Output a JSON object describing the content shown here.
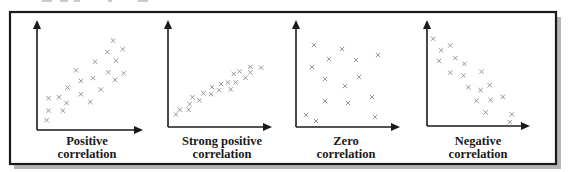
{
  "chart_data": [
    {
      "type": "scatter",
      "title": "",
      "label_lines": [
        "Positive",
        "correlation"
      ],
      "xlabel": "",
      "ylabel": "",
      "xlim": [
        0,
        100
      ],
      "ylim": [
        0,
        100
      ],
      "grid": false,
      "marker": "x",
      "points": [
        [
          77,
          89
        ],
        [
          87,
          80
        ],
        [
          71,
          77
        ],
        [
          58,
          67
        ],
        [
          80,
          68
        ],
        [
          38,
          58
        ],
        [
          72,
          56
        ],
        [
          88,
          55
        ],
        [
          43,
          47
        ],
        [
          56,
          50
        ],
        [
          79,
          48
        ],
        [
          29,
          40
        ],
        [
          64,
          38
        ],
        [
          43,
          33
        ],
        [
          9,
          29
        ],
        [
          20,
          30
        ],
        [
          28,
          24
        ],
        [
          53,
          25
        ],
        [
          9,
          16
        ],
        [
          24,
          16
        ],
        [
          7,
          6
        ]
      ]
    },
    {
      "type": "scatter",
      "title": "",
      "label_lines": [
        "Strong positive",
        "correlation"
      ],
      "xlabel": "",
      "ylabel": "",
      "xlim": [
        0,
        100
      ],
      "ylim": [
        0,
        100
      ],
      "grid": false,
      "marker": "x",
      "points": [
        [
          82,
          72
        ],
        [
          93,
          71
        ],
        [
          71,
          66
        ],
        [
          82,
          65
        ],
        [
          65,
          63
        ],
        [
          77,
          58
        ],
        [
          59,
          52
        ],
        [
          67,
          52
        ],
        [
          52,
          50
        ],
        [
          43,
          46
        ],
        [
          50,
          42
        ],
        [
          62,
          43
        ],
        [
          34,
          38
        ],
        [
          42,
          37
        ],
        [
          23,
          33
        ],
        [
          30,
          29
        ],
        [
          20,
          24
        ],
        [
          10,
          17
        ],
        [
          19,
          17
        ],
        [
          6,
          11
        ]
      ]
    },
    {
      "type": "scatter",
      "title": "",
      "label_lines": [
        "Zero",
        "correlation"
      ],
      "xlabel": "",
      "ylabel": "",
      "xlim": [
        0,
        100
      ],
      "ylim": [
        0,
        100
      ],
      "grid": false,
      "marker": "x",
      "points": [
        [
          16,
          82
        ],
        [
          44,
          78
        ],
        [
          31,
          68
        ],
        [
          58,
          67
        ],
        [
          80,
          72
        ],
        [
          14,
          60
        ],
        [
          27,
          48
        ],
        [
          61,
          50
        ],
        [
          47,
          41
        ],
        [
          74,
          30
        ],
        [
          27,
          26
        ],
        [
          50,
          24
        ],
        [
          8,
          12
        ],
        [
          18,
          6
        ],
        [
          77,
          10
        ]
      ]
    },
    {
      "type": "scatter",
      "title": "",
      "label_lines": [
        "Negative",
        "correlation"
      ],
      "xlabel": "",
      "ylabel": "",
      "xlim": [
        0,
        100
      ],
      "ylim": [
        0,
        100
      ],
      "grid": false,
      "marker": "x",
      "points": [
        [
          8,
          89
        ],
        [
          16,
          77
        ],
        [
          25,
          82
        ],
        [
          14,
          66
        ],
        [
          30,
          69
        ],
        [
          39,
          63
        ],
        [
          25,
          54
        ],
        [
          38,
          51
        ],
        [
          56,
          55
        ],
        [
          43,
          39
        ],
        [
          55,
          36
        ],
        [
          64,
          41
        ],
        [
          51,
          25
        ],
        [
          65,
          26
        ],
        [
          77,
          29
        ],
        [
          60,
          13
        ],
        [
          86,
          11
        ],
        [
          84,
          3
        ]
      ]
    }
  ]
}
